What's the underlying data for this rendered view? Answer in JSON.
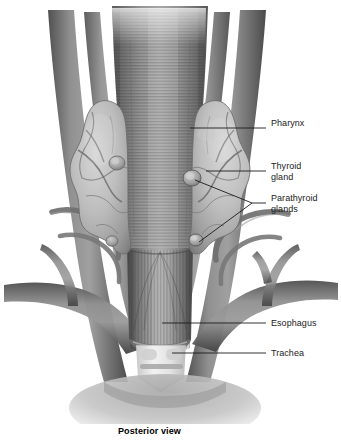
{
  "figure": {
    "caption": "Posterior view",
    "view": "Posterior view",
    "style": "grayscale medical illustration",
    "background_color": "#ffffff",
    "ink_color": "#1b1b1b"
  },
  "labels": [
    {
      "id": "pharynx",
      "text": "Pharynx",
      "x": 271,
      "y": 123,
      "leader_from": [
        266,
        128
      ],
      "leader_to": [
        190,
        128
      ]
    },
    {
      "id": "thyroid",
      "text": "Thyroid",
      "x": 271,
      "y": 166,
      "leader_from": [
        266,
        171
      ],
      "leader_to": [
        206,
        171
      ]
    },
    {
      "id": "thyroid2",
      "text": "gland",
      "x": 271,
      "y": 177
    },
    {
      "id": "parathyroid",
      "text": "Parathyroid",
      "x": 271,
      "y": 198,
      "leader_from": [
        266,
        203
      ],
      "leader_to": [
        252,
        203
      ]
    },
    {
      "id": "parathyroid2",
      "text": "glands",
      "x": 271,
      "y": 209
    },
    {
      "id": "esophagus",
      "text": "Esophagus",
      "x": 271,
      "y": 318,
      "leader_from": [
        266,
        323
      ],
      "leader_to": [
        162,
        323
      ]
    },
    {
      "id": "trachea",
      "text": "Trachea",
      "x": 271,
      "y": 348,
      "leader_from": [
        266,
        353
      ],
      "leader_to": [
        172,
        353
      ]
    }
  ],
  "structures": [
    {
      "name": "pharynx",
      "description": "muscular tube, horizontally striated, widest at top, tapering inferiorly"
    },
    {
      "name": "thyroid-gland-left-lobe",
      "description": "lobulated gland lateral to pharynx, left of midline"
    },
    {
      "name": "thyroid-gland-right-lobe",
      "description": "lobulated gland lateral to pharynx, right of midline"
    },
    {
      "name": "parathyroid-gland-superior",
      "description": "small oval gland on posterior thyroid, upper pole"
    },
    {
      "name": "parathyroid-gland-inferior",
      "description": "small oval gland on posterior thyroid, lower pole"
    },
    {
      "name": "esophagus",
      "description": "cylindrical tube inferior to pharynx with longitudinal striations, cut end"
    },
    {
      "name": "trachea",
      "description": "cartilage rings visible behind the cut esophagus"
    },
    {
      "name": "carotid-arteries",
      "description": "paired vertical vessels lateral to the pharynx"
    },
    {
      "name": "jugular-veins",
      "description": "paired vessels descending and branching inferolaterally"
    },
    {
      "name": "thyroid-vessels",
      "description": "small branching vessels over gland surfaces"
    }
  ],
  "colors": {
    "tissue_dark": "#5c5c5c",
    "tissue_mid": "#8a8a8a",
    "tissue_light": "#c9c9c9",
    "gland_fill": "#b9b9b9",
    "cartilage": "#e6e6e6",
    "leader_line": "#1b1b1b"
  }
}
